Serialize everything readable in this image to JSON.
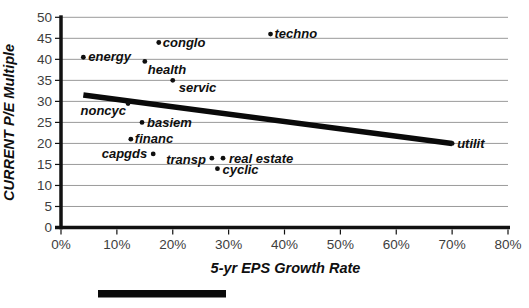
{
  "page": {
    "background": "#ffffff"
  },
  "chart_data": {
    "type": "scatter",
    "title": "",
    "xlabel": "5-yr EPS Growth Rate",
    "ylabel": "CURRENT P/E Multiple",
    "xlim": [
      0,
      80
    ],
    "ylim": [
      0,
      50
    ],
    "x_tick_values": [
      0,
      10,
      20,
      30,
      40,
      50,
      60,
      70,
      80
    ],
    "x_tick_labels": [
      "0%",
      "10%",
      "20%",
      "30%",
      "40%",
      "50%",
      "60%",
      "70%",
      "80%"
    ],
    "y_tick_values": [
      50,
      45,
      40,
      35,
      30,
      25,
      20,
      15,
      10,
      5,
      0
    ],
    "y_tick_labels": [
      "50",
      "45",
      "40",
      "35",
      "30",
      "25",
      "20",
      "15",
      "10",
      "5",
      "0"
    ],
    "grid": "horizontal-gray-lines",
    "legend_position": "below-xlabel-solid-bar-no-text",
    "points": [
      {
        "label": "energy",
        "x": 4,
        "y": 40.5,
        "anchor": "start",
        "dx": 5,
        "dy": 4
      },
      {
        "label": "conglo",
        "x": 17.5,
        "y": 44,
        "anchor": "start",
        "dx": 4,
        "dy": 4
      },
      {
        "label": "health",
        "x": 15,
        "y": 39.5,
        "anchor": "start",
        "dx": 3,
        "dy": 13
      },
      {
        "label": "servic",
        "x": 20,
        "y": 35,
        "anchor": "start",
        "dx": 6,
        "dy": 12
      },
      {
        "label": "noncyc",
        "x": 12,
        "y": 29.5,
        "anchor": "end",
        "dx": -2,
        "dy": 12
      },
      {
        "label": "basiem",
        "x": 14.5,
        "y": 25,
        "anchor": "start",
        "dx": 5,
        "dy": 5
      },
      {
        "label": "financ",
        "x": 12.5,
        "y": 21,
        "anchor": "start",
        "dx": 4,
        "dy": 4
      },
      {
        "label": "capgds",
        "x": 16.5,
        "y": 17.5,
        "anchor": "end",
        "dx": -6,
        "dy": 4
      },
      {
        "label": "transp",
        "x": 27,
        "y": 16.5,
        "anchor": "end",
        "dx": -6,
        "dy": 6
      },
      {
        "label": "real estate",
        "x": 29,
        "y": 16.5,
        "anchor": "start",
        "dx": 6,
        "dy": 5
      },
      {
        "label": "cyclic",
        "x": 28,
        "y": 14,
        "anchor": "start",
        "dx": 5,
        "dy": 5
      },
      {
        "label": "techno",
        "x": 37.5,
        "y": 46,
        "anchor": "start",
        "dx": 4,
        "dy": 4
      },
      {
        "label": "utilit",
        "x": 70,
        "y": 20,
        "anchor": "start",
        "dx": 5,
        "dy": 5
      }
    ],
    "trend_line": {
      "x1": 4,
      "y1": 31.5,
      "x2": 70,
      "y2": 20,
      "description": "thick solid black regression line sloping down to utilit"
    },
    "colors": {
      "point": "#0f0f0f",
      "trend_line": "#0a0a0a",
      "gridline": "#9a9a9a",
      "axis": "#111111",
      "tick_text": "#3d3d3d",
      "label_text": "#0f0f0f",
      "legend_bar": "#0a0a0a",
      "background": "#ffffff"
    }
  }
}
